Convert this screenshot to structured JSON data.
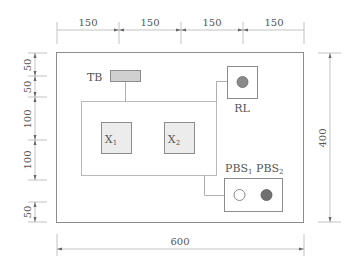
{
  "diagram": {
    "type": "control-panel-layout-drawing",
    "units": "mm",
    "panel": {
      "width": 600,
      "height": 400
    },
    "dimensions": {
      "top": [
        {
          "label": "150"
        },
        {
          "label": "150"
        },
        {
          "label": "150"
        },
        {
          "label": "150"
        }
      ],
      "left": [
        {
          "label": "50"
        },
        {
          "label": "50"
        },
        {
          "label": "100"
        },
        {
          "label": "100"
        },
        {
          "label": "50"
        }
      ],
      "bottom": {
        "label": "600"
      },
      "right": {
        "label": "400"
      }
    },
    "components": {
      "terminal_block": {
        "label": "TB",
        "fill": "#d0d0d0"
      },
      "contactor_1": {
        "label": "X",
        "subscript": "1"
      },
      "contactor_2": {
        "label": "X",
        "subscript": "2"
      },
      "indicator_lamp": {
        "label": "RL",
        "lamp_color": "#8a8a8a"
      },
      "pushbutton_1": {
        "label": "PBS",
        "subscript": "1",
        "style": "hollow"
      },
      "pushbutton_2": {
        "label": "PBS",
        "subscript": "2",
        "style": "filled",
        "fill": "#707070"
      }
    },
    "colors": {
      "line": "#8c8c8c",
      "dim_line": "#b4b4b4",
      "text": "#555555",
      "box_fill": "#ececec"
    }
  }
}
